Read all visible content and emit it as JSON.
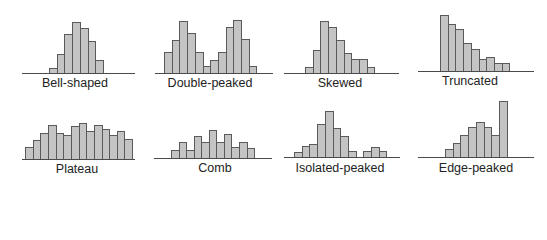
{
  "figure": {
    "colors": {
      "bar_fill": "#c4c4c4",
      "bar_edge": "#5a5a5a",
      "axis": "#4a4a4a",
      "text": "#222222"
    }
  },
  "chart_data": [
    {
      "type": "bar",
      "title": "Bell-shaped",
      "values": [
        5,
        19,
        39,
        51,
        45,
        32,
        13
      ],
      "ylim": [
        0,
        60
      ],
      "grid": false
    },
    {
      "type": "bar",
      "title": "Double-peaked",
      "values": [
        21,
        33,
        52,
        40,
        21,
        7,
        13,
        21,
        46,
        53,
        34,
        7
      ],
      "ylim": [
        0,
        60
      ],
      "grid": false
    },
    {
      "type": "bar",
      "title": "Skewed",
      "values": [
        6,
        23,
        52,
        46,
        33,
        20,
        14,
        14,
        6
      ],
      "ylim": [
        0,
        60
      ],
      "grid": false
    },
    {
      "type": "bar",
      "title": "Truncated",
      "values": [
        56,
        47,
        42,
        28,
        22,
        12,
        14,
        8,
        8
      ],
      "ylim": [
        0,
        60
      ],
      "grid": false
    },
    {
      "type": "bar",
      "title": "Plateau",
      "values": [
        12,
        19,
        26,
        34,
        26,
        24,
        33,
        36,
        28,
        34,
        30,
        24,
        28,
        20
      ],
      "ylim": [
        0,
        60
      ],
      "grid": false
    },
    {
      "type": "bar",
      "title": "Comb",
      "values": [
        8,
        16,
        8,
        22,
        16,
        28,
        16,
        24,
        11,
        16,
        10
      ],
      "ylim": [
        0,
        60
      ],
      "grid": false
    },
    {
      "type": "bar",
      "title": "Isolated-peaked",
      "values": [
        5,
        11,
        13,
        33,
        46,
        29,
        21,
        6,
        0,
        6,
        10,
        6
      ],
      "ylim": [
        0,
        60
      ],
      "grid": false
    },
    {
      "type": "bar",
      "title": "Edge-peaked",
      "values": [
        8,
        14,
        22,
        30,
        35,
        30,
        22,
        56
      ],
      "ylim": [
        0,
        60
      ],
      "grid": false
    }
  ],
  "layout": [
    {
      "axis_x": 22,
      "axis_w": 113,
      "baseline": 73,
      "bar_x": 49,
      "bar_w": 7.7,
      "label_x": 75,
      "label_y": 76
    },
    {
      "axis_x": 155,
      "axis_w": 118,
      "baseline": 73,
      "bar_x": 164,
      "bar_w": 7.7,
      "label_x": 210,
      "label_y": 76
    },
    {
      "axis_x": 284,
      "axis_w": 115,
      "baseline": 73,
      "bar_x": 305,
      "bar_w": 7.7,
      "label_x": 340,
      "label_y": 76
    },
    {
      "axis_x": 418,
      "axis_w": 116,
      "baseline": 71,
      "bar_x": 440,
      "bar_w": 7.7,
      "label_x": 470,
      "label_y": 74
    },
    {
      "axis_x": 22,
      "axis_w": 113,
      "baseline": 159,
      "bar_x": 25,
      "bar_w": 7.65,
      "label_x": 77,
      "label_y": 162
    },
    {
      "axis_x": 154,
      "axis_w": 118,
      "baseline": 158,
      "bar_x": 171,
      "bar_w": 7.55,
      "label_x": 215,
      "label_y": 161
    },
    {
      "axis_x": 284,
      "axis_w": 116,
      "baseline": 157,
      "bar_x": 294,
      "bar_w": 7.7,
      "label_x": 340,
      "label_y": 161
    },
    {
      "axis_x": 418,
      "axis_w": 116,
      "baseline": 157,
      "bar_x": 445,
      "bar_w": 7.7,
      "label_x": 476,
      "label_y": 161
    }
  ]
}
